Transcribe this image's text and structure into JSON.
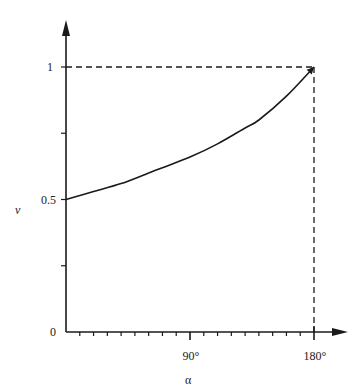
{
  "chart_data": {
    "type": "line",
    "title": "",
    "xlabel": "α",
    "ylabel": "v",
    "xlim": [
      0,
      180
    ],
    "ylim": [
      0,
      1
    ],
    "grid": false,
    "legend": null,
    "x_ticks": [
      {
        "value": 90,
        "label": "90°"
      },
      {
        "value": 180,
        "label": "180°"
      }
    ],
    "x_minor_tick_step": 10,
    "y_ticks": [
      {
        "value": 0,
        "label": "0"
      },
      {
        "value": 0.25,
        "label": ""
      },
      {
        "value": 0.5,
        "label": "0.5"
      },
      {
        "value": 0.75,
        "label": ""
      },
      {
        "value": 1,
        "label": "1"
      }
    ],
    "series": [
      {
        "name": "v(α)",
        "x": [
          0,
          20,
          40,
          60,
          70,
          90,
          110,
          130,
          140,
          160,
          180
        ],
        "y": [
          0.5,
          0.53,
          0.56,
          0.6,
          0.62,
          0.66,
          0.71,
          0.77,
          0.8,
          0.89,
          1.0
        ]
      }
    ],
    "annotations": [
      {
        "type": "dashed-guide",
        "from": [
          0,
          1
        ],
        "to": [
          180,
          1
        ]
      },
      {
        "type": "dashed-guide",
        "from": [
          180,
          1
        ],
        "to": [
          180,
          0
        ]
      }
    ]
  },
  "labels": {
    "x_axis_name": "α",
    "y_axis_name": "v",
    "y_tick_0": "0",
    "y_tick_05": "0.5",
    "y_tick_1": "1",
    "x_tick_90": "90°",
    "x_tick_180": "180°"
  },
  "colors": {
    "ink": "#1a1a1a",
    "background": "#ffffff"
  }
}
